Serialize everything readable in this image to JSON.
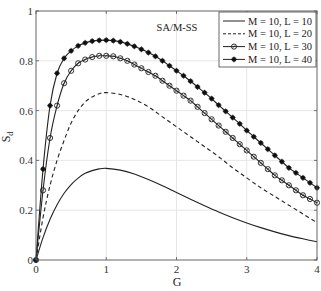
{
  "chart_data": {
    "type": "line",
    "title": "",
    "xlabel": "G",
    "ylabel": "S",
    "ylabel_subscript": "d",
    "xlim": [
      0,
      4
    ],
    "ylim": [
      0,
      1
    ],
    "xticks": [
      0,
      1,
      2,
      3,
      4
    ],
    "xtick_labels": [
      "0",
      "1",
      "2",
      "3",
      "4"
    ],
    "yticks": [
      0,
      0.2,
      0.4,
      0.6,
      0.8,
      1
    ],
    "ytick_labels": [
      "0",
      "0.2",
      "0.4",
      "0.6",
      "0.8",
      "1"
    ],
    "grid": true,
    "legend_position": "top-right",
    "annotation": "SA/M-SS",
    "series": [
      {
        "name": "M = 10, L = 10",
        "style": "solid",
        "marker": "none",
        "x": [
          0,
          0.1,
          0.2,
          0.3,
          0.4,
          0.5,
          0.6,
          0.7,
          0.8,
          0.9,
          1.0,
          1.2,
          1.4,
          1.6,
          1.8,
          2.0,
          2.2,
          2.4,
          2.6,
          2.8,
          3.0,
          3.2,
          3.4,
          3.6,
          3.8,
          4.0
        ],
        "y": [
          0,
          0.09,
          0.164,
          0.222,
          0.268,
          0.303,
          0.329,
          0.348,
          0.359,
          0.366,
          0.368,
          0.361,
          0.345,
          0.323,
          0.298,
          0.271,
          0.244,
          0.218,
          0.193,
          0.17,
          0.149,
          0.13,
          0.113,
          0.098,
          0.085,
          0.073
        ]
      },
      {
        "name": "M = 10, L = 20",
        "style": "dashed",
        "marker": "none",
        "x": [
          0,
          0.1,
          0.2,
          0.3,
          0.4,
          0.5,
          0.6,
          0.7,
          0.8,
          0.9,
          1.0,
          1.2,
          1.4,
          1.6,
          1.8,
          2.0,
          2.2,
          2.4,
          2.6,
          2.8,
          3.0,
          3.2,
          3.4,
          3.6,
          3.8,
          4.0
        ],
        "y": [
          0,
          0.17,
          0.3,
          0.4,
          0.48,
          0.55,
          0.6,
          0.635,
          0.655,
          0.668,
          0.672,
          0.665,
          0.645,
          0.615,
          0.575,
          0.535,
          0.495,
          0.455,
          0.415,
          0.37,
          0.33,
          0.29,
          0.255,
          0.22,
          0.185,
          0.15
        ]
      },
      {
        "name": "M = 10, L = 30",
        "style": "solid",
        "marker": "open-circle",
        "x": [
          0,
          0.1,
          0.2,
          0.3,
          0.4,
          0.5,
          0.6,
          0.7,
          0.8,
          0.9,
          1.0,
          1.1,
          1.2,
          1.3,
          1.4,
          1.5,
          1.6,
          1.7,
          1.8,
          1.9,
          2.0,
          2.1,
          2.2,
          2.3,
          2.4,
          2.5,
          2.6,
          2.7,
          2.8,
          2.9,
          3.0,
          3.1,
          3.2,
          3.3,
          3.4,
          3.5,
          3.6,
          3.7,
          3.8,
          3.9,
          4.0
        ],
        "y": [
          0,
          0.28,
          0.49,
          0.62,
          0.71,
          0.76,
          0.79,
          0.805,
          0.815,
          0.82,
          0.82,
          0.818,
          0.81,
          0.8,
          0.785,
          0.77,
          0.755,
          0.74,
          0.72,
          0.7,
          0.68,
          0.66,
          0.64,
          0.615,
          0.59,
          0.565,
          0.54,
          0.515,
          0.49,
          0.465,
          0.44,
          0.415,
          0.39,
          0.365,
          0.34,
          0.32,
          0.3,
          0.28,
          0.26,
          0.245,
          0.23
        ]
      },
      {
        "name": "M = 10, L = 40",
        "style": "solid",
        "marker": "filled-star",
        "x": [
          0,
          0.1,
          0.2,
          0.3,
          0.4,
          0.5,
          0.6,
          0.7,
          0.8,
          0.9,
          1.0,
          1.1,
          1.2,
          1.3,
          1.4,
          1.5,
          1.6,
          1.7,
          1.8,
          1.9,
          2.0,
          2.1,
          2.2,
          2.3,
          2.4,
          2.5,
          2.6,
          2.7,
          2.8,
          2.9,
          3.0,
          3.1,
          3.2,
          3.3,
          3.4,
          3.5,
          3.6,
          3.7,
          3.8,
          3.9,
          4.0
        ],
        "y": [
          0,
          0.365,
          0.62,
          0.75,
          0.81,
          0.84,
          0.86,
          0.872,
          0.879,
          0.882,
          0.883,
          0.881,
          0.876,
          0.868,
          0.858,
          0.846,
          0.833,
          0.818,
          0.8,
          0.78,
          0.76,
          0.74,
          0.718,
          0.695,
          0.672,
          0.648,
          0.622,
          0.597,
          0.572,
          0.547,
          0.52,
          0.495,
          0.47,
          0.445,
          0.42,
          0.395,
          0.37,
          0.35,
          0.33,
          0.31,
          0.29
        ]
      }
    ]
  }
}
